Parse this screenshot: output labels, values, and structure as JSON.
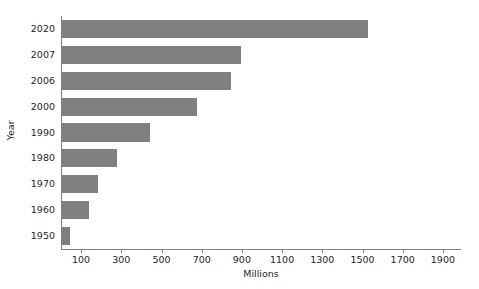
{
  "chart_data": {
    "type": "bar",
    "orientation": "horizontal",
    "title": "",
    "xlabel": "Millions",
    "ylabel": "Year",
    "categories": [
      "2020",
      "2007",
      "2006",
      "2000",
      "1990",
      "1980",
      "1970",
      "1960",
      "1950"
    ],
    "values": [
      1525,
      895,
      845,
      675,
      445,
      280,
      185,
      140,
      45
    ],
    "xlim": [
      0,
      1990
    ],
    "xticks": [
      100,
      300,
      500,
      700,
      900,
      1100,
      1300,
      1500,
      1700,
      1900
    ],
    "xtick_labels": [
      "100",
      "300",
      "500",
      "700",
      "900",
      "1100",
      "1300",
      "1500",
      "1700",
      "1900"
    ],
    "grid": false,
    "legend": false,
    "bar_color": "#808080",
    "axis_color": "#808080",
    "text_color": "#231f20"
  }
}
